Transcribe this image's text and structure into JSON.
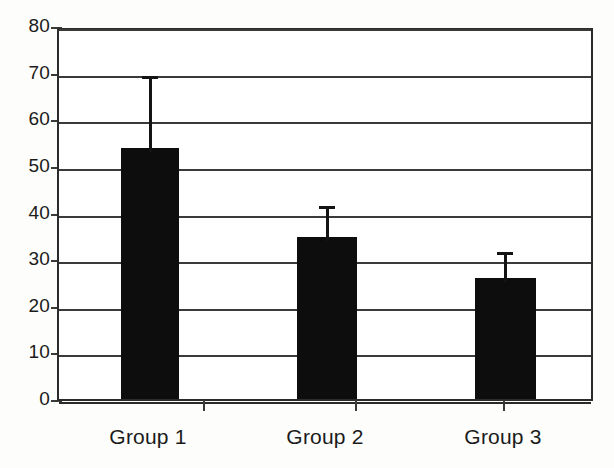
{
  "chart_data": {
    "type": "bar",
    "title": "",
    "subtitle": "",
    "xlabel": "",
    "ylabel": "",
    "categories": [
      "Group 1",
      "Group 2",
      "Group 3"
    ],
    "values": [
      53.8,
      34.7,
      25.9
    ],
    "error_upper": [
      16.3,
      7.5,
      6.5
    ],
    "error_bar_tops": [
      70.1,
      42.2,
      32.4
    ],
    "error_bar_direction": "upper-only",
    "ylim": [
      0,
      80
    ],
    "ytick_values": [
      0,
      10,
      20,
      30,
      40,
      50,
      60,
      70,
      80
    ],
    "ytick_labels": [
      "0",
      "10",
      "20",
      "30",
      "40",
      "50",
      "60",
      "70",
      "80"
    ],
    "grid": "horizontal",
    "legend": "none",
    "bar_color": "#0d0d0d",
    "frame_color": "#2b2b2b",
    "gridline_color": "#3a3a38",
    "background_color": "#ffffff"
  },
  "axes": {
    "y_axis_name": "y-axis",
    "x_axis_name": "x-axis"
  }
}
